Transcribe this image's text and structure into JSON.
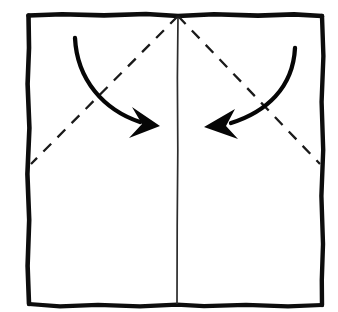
{
  "figure": {
    "background_color": "#ffffff",
    "ink_color": "#0d0d0d",
    "width": 338,
    "height": 312
  },
  "paper": {
    "name": "square-sheet-outline",
    "style": "hand-drawn-rough-border",
    "stroke_width": 4.5,
    "corners": {
      "top_left": [
        28,
        15
      ],
      "top_right": [
        322,
        16
      ],
      "bottom_right": [
        322,
        305
      ],
      "bottom_left": [
        29,
        304
      ]
    }
  },
  "creases": {
    "center_vertical": {
      "name": "center-vertical-crease",
      "line_type": "solid-thin",
      "stroke_width": 1.6,
      "from": [
        178,
        16
      ],
      "to": [
        177,
        304
      ]
    },
    "diagonal_left": {
      "name": "left-diagonal-crease",
      "line_type": "dashed",
      "stroke_width": 2.2,
      "dash_pattern": "11 9",
      "from": [
        178,
        16
      ],
      "to": [
        31,
        164
      ]
    },
    "diagonal_right": {
      "name": "right-diagonal-crease",
      "line_type": "dashed",
      "stroke_width": 2.2,
      "dash_pattern": "11 9",
      "from": [
        178,
        16
      ],
      "to": [
        320,
        164
      ]
    }
  },
  "arrows": [
    {
      "name": "fold-arrow-left",
      "direction": "down-right",
      "shaft_width": 4.2,
      "start": [
        75,
        38
      ],
      "control_1": [
        78,
        82
      ],
      "control_2": [
        108,
        112
      ],
      "end": [
        138,
        123
      ],
      "head_tip": [
        159,
        126
      ],
      "head_back_upper": [
        133,
        108
      ],
      "head_notch": [
        141,
        124
      ],
      "head_back_lower": [
        131,
        137
      ]
    },
    {
      "name": "fold-arrow-right",
      "direction": "down-left",
      "shaft_width": 4.2,
      "start": [
        295,
        48
      ],
      "control_1": [
        292,
        88
      ],
      "control_2": [
        262,
        114
      ],
      "end": [
        233,
        124
      ],
      "head_tip": [
        205,
        127
      ],
      "head_back_upper": [
        234,
        110
      ],
      "head_notch": [
        227,
        126
      ],
      "head_back_lower": [
        232,
        138
      ]
    }
  ]
}
